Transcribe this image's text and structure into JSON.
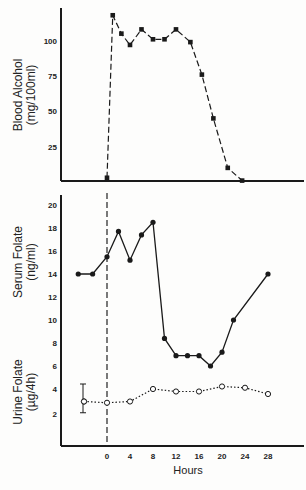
{
  "chart_data": [
    {
      "type": "line",
      "title": "Blood Alcohol",
      "ylabel": "Blood Alcohol (mg/100ml)",
      "ylabel_line1": "Blood Alcohol",
      "ylabel_line2": "(mg/100ml)",
      "xlabel": "",
      "ylim": [
        0,
        125
      ],
      "yticks": [
        25,
        50,
        75,
        100
      ],
      "line_style": "dashed",
      "marker": "filled-square",
      "series": [
        {
          "name": "Blood Alcohol",
          "x": [
            0,
            1,
            2.5,
            4,
            6,
            8,
            10,
            12,
            14.5,
            16.5,
            18.5,
            21,
            23.5
          ],
          "values": [
            3,
            118,
            105,
            97,
            108,
            101,
            101,
            108,
            99,
            76,
            45,
            10,
            1
          ]
        }
      ]
    },
    {
      "type": "line",
      "title": "Serum Folate",
      "ylabel": "Serum Folate (ng/ml)",
      "ylabel_line1": "Serum Folate",
      "ylabel_line2": "(ng/ml)",
      "ylim": [
        5,
        21
      ],
      "yticks": [
        6,
        8,
        10,
        12,
        14,
        16,
        18,
        20
      ],
      "line_style": "solid",
      "marker": "filled-circle",
      "series": [
        {
          "name": "Serum Folate",
          "x": [
            -5,
            -2.5,
            0,
            2,
            4,
            6,
            8,
            10,
            12,
            14,
            16,
            18,
            20,
            22,
            28
          ],
          "values": [
            14.0,
            14.0,
            15.5,
            17.7,
            15.2,
            17.4,
            18.5,
            8.4,
            6.9,
            6.9,
            6.9,
            6.0,
            7.2,
            10.0,
            14.0
          ]
        }
      ]
    },
    {
      "type": "line",
      "title": "Urine Folate",
      "ylabel": "Urine Folate (µg/4h)",
      "ylabel_line1": "Urine Folate",
      "ylabel_line2": "(µg/4h)",
      "ylim": [
        0,
        5
      ],
      "yticks": [
        2,
        4
      ],
      "line_style": "dotted",
      "marker": "open-circle",
      "series": [
        {
          "name": "Urine Folate",
          "x": [
            -4,
            0,
            4,
            8,
            12,
            16,
            20,
            24,
            28
          ],
          "values": [
            3.0,
            2.9,
            3.0,
            4.0,
            3.8,
            3.8,
            4.2,
            4.1,
            3.6
          ],
          "error_bar": {
            "x": -4,
            "low": 2.1,
            "high": 4.4
          }
        }
      ]
    }
  ],
  "x_axis": {
    "label": "Hours",
    "ticks": [
      0,
      4,
      8,
      12,
      16,
      20,
      24,
      28
    ],
    "tick_labels": [
      "0",
      "4",
      "8",
      "12",
      "16",
      "20",
      "24",
      "28"
    ]
  },
  "annotations": {
    "vertical_reference_line": {
      "x": 0,
      "style": "dashed"
    }
  },
  "colors": {
    "ink": "#1a1a1a",
    "background": "#fdfdfc"
  }
}
